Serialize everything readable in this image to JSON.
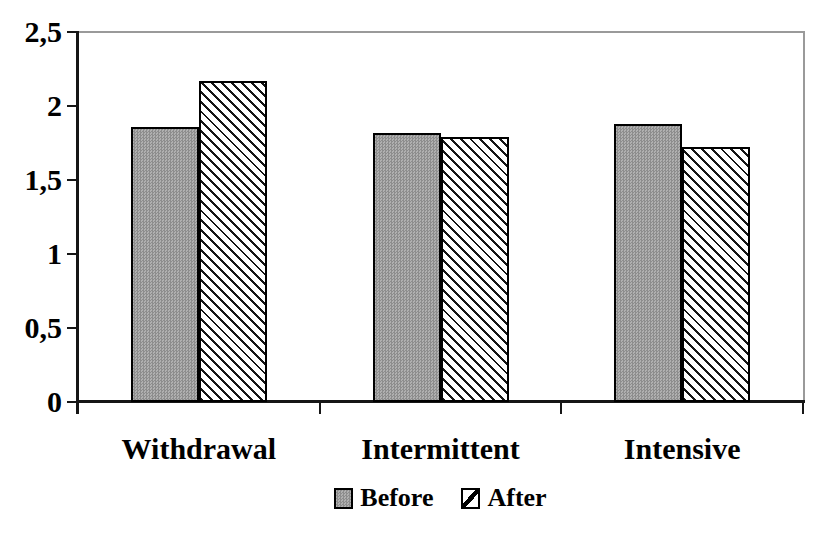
{
  "chart_data": {
    "type": "bar",
    "categories": [
      "Withdrawal",
      "Intermittent",
      "Intensive"
    ],
    "series": [
      {
        "name": "Before",
        "values": [
          1.86,
          1.82,
          1.88
        ],
        "pattern": "gray-halftone"
      },
      {
        "name": "After",
        "values": [
          2.17,
          1.79,
          1.72
        ],
        "pattern": "diagonal-hatch"
      }
    ],
    "title": "",
    "xlabel": "",
    "ylabel": "",
    "ylim": [
      0,
      2.5
    ],
    "ytick_step": 0.5,
    "ytick_labels": [
      "0",
      "0,5",
      "1",
      "1,5",
      "2",
      "2,5"
    ],
    "decimal_separator": ",",
    "grid": false,
    "legend_position": "bottom",
    "legend_entries": [
      "Before",
      "After"
    ]
  },
  "colors": {
    "background": "#ffffff",
    "text": "#000000",
    "axis": "#161616",
    "plot_border": "#9a9a9a",
    "bar_border": "#000000",
    "before_fill": "#a2a2a2",
    "after_fill": "#ffffff",
    "hatch_stroke": "#151515"
  }
}
